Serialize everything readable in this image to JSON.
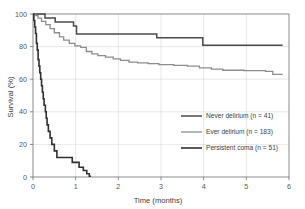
{
  "chart_data": {
    "type": "line",
    "title": "",
    "subtitle": "",
    "xlabel": "Time (months)",
    "ylabel": "Survival (%)",
    "xlim": [
      0,
      6
    ],
    "ylim": [
      0,
      100
    ],
    "xticks": [
      "0",
      "1",
      "2",
      "3",
      "4",
      "5",
      "6"
    ],
    "yticks": [
      "0",
      "20",
      "40",
      "60",
      "80",
      "100"
    ],
    "xtick_values": [
      0,
      1,
      2,
      3,
      4,
      5,
      6
    ],
    "ytick_values": [
      0,
      20,
      40,
      60,
      80,
      100
    ],
    "grid": "vertical-and-horizontal-faint",
    "legend_position": "center-right",
    "curve_style": "kaplan-meier-step",
    "series": [
      {
        "name": "Never delirium (n = 41)",
        "group": "never-delirium",
        "n": 41,
        "color": "#4b4b4d",
        "linewidth": 1.5,
        "steps": [
          [
            0.0,
            100.0
          ],
          [
            0.28,
            100.0
          ],
          [
            0.28,
            97.6
          ],
          [
            0.52,
            97.6
          ],
          [
            0.52,
            95.1
          ],
          [
            0.95,
            95.1
          ],
          [
            0.95,
            92.7
          ],
          [
            1.02,
            92.7
          ],
          [
            1.02,
            87.8
          ],
          [
            2.9,
            87.8
          ],
          [
            2.9,
            85.4
          ],
          [
            3.98,
            85.4
          ],
          [
            3.98,
            80.9
          ],
          [
            5.85,
            80.9
          ]
        ]
      },
      {
        "name": "Ever delirium (n = 183)",
        "group": "ever-delirium",
        "n": 183,
        "color": "#8d8d90",
        "linewidth": 1.3,
        "steps": [
          [
            0.0,
            100.0
          ],
          [
            0.06,
            100.0
          ],
          [
            0.06,
            99.0
          ],
          [
            0.12,
            99.0
          ],
          [
            0.12,
            97.5
          ],
          [
            0.2,
            97.5
          ],
          [
            0.2,
            95.5
          ],
          [
            0.3,
            95.5
          ],
          [
            0.3,
            93.5
          ],
          [
            0.4,
            93.5
          ],
          [
            0.4,
            91.0
          ],
          [
            0.5,
            91.0
          ],
          [
            0.5,
            88.5
          ],
          [
            0.62,
            88.5
          ],
          [
            0.62,
            86.0
          ],
          [
            0.72,
            86.0
          ],
          [
            0.72,
            84.0
          ],
          [
            0.85,
            84.0
          ],
          [
            0.85,
            82.0
          ],
          [
            0.98,
            82.0
          ],
          [
            0.98,
            80.5
          ],
          [
            1.12,
            80.5
          ],
          [
            1.12,
            79.5
          ],
          [
            1.25,
            79.5
          ],
          [
            1.25,
            77.0
          ],
          [
            1.38,
            77.0
          ],
          [
            1.38,
            75.5
          ],
          [
            1.52,
            75.5
          ],
          [
            1.52,
            74.5
          ],
          [
            1.7,
            74.5
          ],
          [
            1.7,
            73.5
          ],
          [
            1.88,
            73.5
          ],
          [
            1.88,
            72.5
          ],
          [
            2.05,
            72.5
          ],
          [
            2.05,
            71.5
          ],
          [
            2.25,
            71.5
          ],
          [
            2.25,
            70.5
          ],
          [
            2.45,
            70.5
          ],
          [
            2.45,
            70.0
          ],
          [
            2.7,
            70.0
          ],
          [
            2.7,
            69.5
          ],
          [
            2.95,
            69.5
          ],
          [
            2.95,
            69.0
          ],
          [
            3.3,
            69.0
          ],
          [
            3.3,
            68.5
          ],
          [
            3.62,
            68.5
          ],
          [
            3.62,
            68.0
          ],
          [
            3.9,
            68.0
          ],
          [
            3.9,
            67.0
          ],
          [
            4.18,
            67.0
          ],
          [
            4.18,
            66.2
          ],
          [
            4.45,
            66.2
          ],
          [
            4.45,
            65.5
          ],
          [
            4.95,
            65.5
          ],
          [
            4.95,
            65.2
          ],
          [
            5.45,
            65.2
          ],
          [
            5.45,
            64.8
          ],
          [
            5.62,
            64.8
          ],
          [
            5.62,
            63.0
          ],
          [
            5.85,
            63.0
          ]
        ]
      },
      {
        "name": "Persistent coma (n = 51)",
        "group": "persistent-coma",
        "n": 51,
        "color": "#303032",
        "linewidth": 1.6,
        "steps": [
          [
            0.0,
            100.0
          ],
          [
            0.02,
            100.0
          ],
          [
            0.02,
            96.0
          ],
          [
            0.04,
            96.0
          ],
          [
            0.04,
            92.0
          ],
          [
            0.06,
            92.0
          ],
          [
            0.06,
            88.0
          ],
          [
            0.08,
            88.0
          ],
          [
            0.08,
            82.0
          ],
          [
            0.1,
            82.0
          ],
          [
            0.1,
            78.0
          ],
          [
            0.12,
            78.0
          ],
          [
            0.12,
            72.0
          ],
          [
            0.14,
            72.0
          ],
          [
            0.14,
            68.0
          ],
          [
            0.16,
            68.0
          ],
          [
            0.16,
            64.0
          ],
          [
            0.18,
            64.0
          ],
          [
            0.18,
            60.0
          ],
          [
            0.2,
            60.0
          ],
          [
            0.2,
            56.0
          ],
          [
            0.22,
            56.0
          ],
          [
            0.22,
            52.0
          ],
          [
            0.24,
            52.0
          ],
          [
            0.24,
            48.0
          ],
          [
            0.26,
            48.0
          ],
          [
            0.26,
            44.0
          ],
          [
            0.29,
            44.0
          ],
          [
            0.29,
            40.0
          ],
          [
            0.31,
            40.0
          ],
          [
            0.31,
            36.0
          ],
          [
            0.33,
            36.0
          ],
          [
            0.33,
            32.0
          ],
          [
            0.36,
            32.0
          ],
          [
            0.36,
            28.0
          ],
          [
            0.4,
            28.0
          ],
          [
            0.4,
            24.0
          ],
          [
            0.44,
            24.0
          ],
          [
            0.44,
            20.0
          ],
          [
            0.5,
            20.0
          ],
          [
            0.5,
            16.0
          ],
          [
            0.56,
            16.0
          ],
          [
            0.56,
            12.0
          ],
          [
            0.92,
            12.0
          ],
          [
            0.92,
            9.0
          ],
          [
            1.08,
            9.0
          ],
          [
            1.08,
            6.0
          ],
          [
            1.18,
            6.0
          ],
          [
            1.18,
            4.0
          ],
          [
            1.26,
            4.0
          ],
          [
            1.26,
            2.0
          ],
          [
            1.32,
            2.0
          ],
          [
            1.32,
            0.5
          ],
          [
            1.36,
            0.5
          ]
        ]
      }
    ]
  },
  "legend": {
    "entries": [
      {
        "label": "Never delirium (n = 41)",
        "color": "#4b4b4d"
      },
      {
        "label": "Ever delirium (n = 183)",
        "color": "#8d8d90"
      },
      {
        "label": "Persistent coma (n = 51)",
        "color": "#303032"
      }
    ]
  }
}
